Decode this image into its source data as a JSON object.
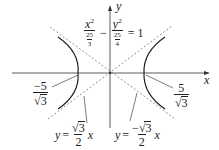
{
  "diagram": {
    "type": "hyperbola-graph",
    "axes": {
      "x_label": "x",
      "y_label": "y"
    },
    "equation": {
      "lhs_term1_num": "x",
      "lhs_term1_num_exp": "2",
      "lhs_term1_den_num": "25",
      "lhs_term1_den_den": "3",
      "operator": "−",
      "lhs_term2_num": "y",
      "lhs_term2_num_exp": "2",
      "lhs_term2_den_num": "25",
      "lhs_term2_den_den": "4",
      "equals": "=",
      "rhs": "1"
    },
    "vertices": {
      "left": {
        "num": "−5",
        "den_radicand": "3",
        "sqrt": "√"
      },
      "right": {
        "num": "5",
        "den_radicand": "3",
        "sqrt": "√"
      }
    },
    "asymptotes": {
      "positive": {
        "lhs": "y",
        "eq": "=",
        "num_sqrt": "√",
        "num_radicand": "3",
        "den": "2",
        "var": "x"
      },
      "negative": {
        "lhs": "y",
        "eq": "=",
        "num_sign": "−",
        "num_sqrt": "√",
        "num_radicand": "3",
        "den": "2",
        "var": "x"
      }
    },
    "colors": {
      "curve": "#222222",
      "axis": "#333333",
      "asymptote": "#777777",
      "leader": "#444444"
    }
  }
}
